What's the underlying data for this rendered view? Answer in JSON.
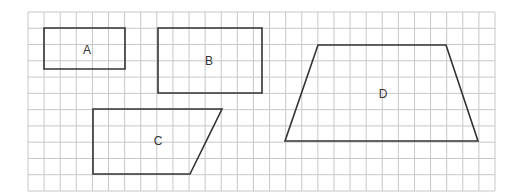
{
  "grid": {
    "left": 28,
    "top": 12,
    "right": 495,
    "bottom": 191,
    "columns": 29,
    "rows": 11,
    "line_color": "#c8c8c8",
    "border_color": "#bdbdbd"
  },
  "shape_stroke": "#333333",
  "shapes": [
    {
      "id": "A",
      "label": "A",
      "kind": "rectangle",
      "points": [
        [
          44,
          28
        ],
        [
          125,
          28
        ],
        [
          125,
          69
        ],
        [
          44,
          69
        ]
      ],
      "label_pos": [
        87,
        50
      ]
    },
    {
      "id": "B",
      "label": "B",
      "kind": "rectangle",
      "points": [
        [
          158,
          28
        ],
        [
          262,
          28
        ],
        [
          262,
          93
        ],
        [
          158,
          93
        ]
      ],
      "label_pos": [
        209,
        61
      ]
    },
    {
      "id": "C",
      "label": "C",
      "kind": "right-trapezoid",
      "points": [
        [
          93,
          109
        ],
        [
          222,
          109
        ],
        [
          190,
          174
        ],
        [
          93,
          174
        ]
      ],
      "label_pos": [
        158,
        141
      ]
    },
    {
      "id": "D",
      "label": "D",
      "kind": "trapezoid",
      "points": [
        [
          318,
          45
        ],
        [
          446,
          45
        ],
        [
          478,
          141
        ],
        [
          285,
          141
        ]
      ],
      "label_pos": [
        383,
        94
      ]
    }
  ]
}
